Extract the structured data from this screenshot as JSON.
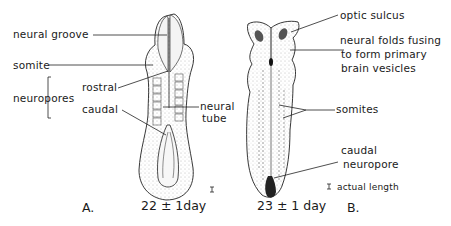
{
  "figure": {
    "panel_a": {
      "letter": "A.",
      "age": "22 ± 1day",
      "labels": {
        "neural_groove": "neural groove",
        "somite": "somite",
        "neuropores": "neuropores",
        "rostral": "rostral",
        "caudal": "caudal",
        "neural_tube_line1": "neural",
        "neural_tube_line2": "tube"
      },
      "scale_mark": "I"
    },
    "panel_b": {
      "letter": "B.",
      "age": "23  ± 1 day",
      "labels": {
        "optic_sulcus": "optic sulcus",
        "neural_folds_line1": "neural folds fusing",
        "neural_folds_line2": "to form primary",
        "neural_folds_line3": "brain vesicles",
        "somites": "somites",
        "caudal_neuropore_line1": "caudal",
        "caudal_neuropore_line2": "neuropore"
      },
      "scale_legend": "actual length",
      "scale_mark": "I"
    },
    "colors": {
      "ink": "#1a1a1a",
      "shade": "#8a8a8a",
      "background": "#ffffff"
    }
  }
}
